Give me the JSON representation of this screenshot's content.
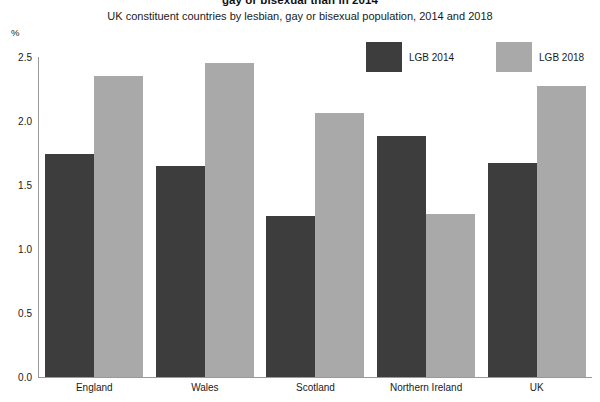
{
  "chart_data": {
    "type": "bar",
    "title": "gay or bisexual than in 2014",
    "subtitle": "UK constituent countries by lesbian, gay or bisexual population, 2014 and 2018",
    "xlabel": "",
    "ylabel": "%",
    "ylim": [
      0.0,
      2.5
    ],
    "yticks": [
      "0.0",
      "0.5",
      "1.0",
      "1.5",
      "2.0",
      "2.5"
    ],
    "ytick_values": [
      0.0,
      0.5,
      1.0,
      1.5,
      2.0,
      2.5
    ],
    "grid": false,
    "legend_position": "top-right",
    "categories": [
      "England",
      "Wales",
      "Scotland",
      "Northern Ireland",
      "UK"
    ],
    "series": [
      {
        "name": "LGB 2014",
        "color": "#3d3d3d",
        "values": [
          1.74,
          1.65,
          1.26,
          1.88,
          1.67
        ]
      },
      {
        "name": "LGB 2018",
        "color": "#a9a9a9",
        "values": [
          2.35,
          2.45,
          2.06,
          1.27,
          2.27
        ]
      }
    ]
  }
}
